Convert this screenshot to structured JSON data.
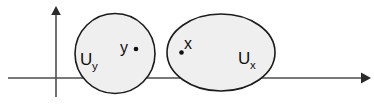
{
  "figure": {
    "name": "disjoint-neighborhoods-diagram",
    "background_color": "#ffffff",
    "width": 374,
    "height": 105
  },
  "axes": {
    "x_axis": {
      "label": "",
      "stroke_color": "#4d4d4d",
      "arrow": "right"
    },
    "y_axis": {
      "label": "",
      "stroke_color": "#4d4d4d",
      "arrow": "up"
    }
  },
  "regions": [
    {
      "id": "region-uy",
      "shape": "circle",
      "label": "U",
      "subscript": "y",
      "fill_color": "#efefef",
      "stroke_color": "#1b1b1b"
    },
    {
      "id": "region-ux",
      "shape": "ellipse",
      "label": "U",
      "subscript": "x",
      "fill_color": "#efefef",
      "stroke_color": "#1b1b1b"
    }
  ],
  "points": [
    {
      "id": "point-y",
      "label": "y",
      "dot_color": "#101010"
    },
    {
      "id": "point-x",
      "label": "x",
      "dot_color": "#101010"
    }
  ]
}
